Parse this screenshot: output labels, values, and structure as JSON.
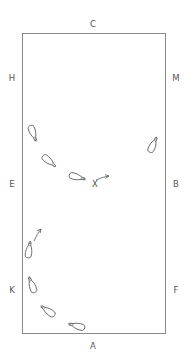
{
  "diagram": {
    "type": "dressage-arena-exercise",
    "arena": {
      "x": 22,
      "y": 33,
      "width": 144,
      "height": 301,
      "stroke": "#8a8a8a"
    },
    "markers": [
      {
        "label": "C",
        "x": 93,
        "y": 24
      },
      {
        "label": "H",
        "x": 12,
        "y": 78
      },
      {
        "label": "M",
        "x": 176,
        "y": 78
      },
      {
        "label": "E",
        "x": 12,
        "y": 184
      },
      {
        "label": "B",
        "x": 176,
        "y": 184
      },
      {
        "label": "X",
        "x": 95,
        "y": 184
      },
      {
        "label": "K",
        "x": 12,
        "y": 290
      },
      {
        "label": "F",
        "x": 176,
        "y": 290
      },
      {
        "label": "A",
        "x": 93,
        "y": 346
      }
    ],
    "horses": [
      {
        "id": "h1",
        "cx": 33,
        "cy": 133,
        "angle": 160
      },
      {
        "id": "h2",
        "cx": 49,
        "cy": 161,
        "angle": 130
      },
      {
        "id": "h3",
        "cx": 77,
        "cy": 177,
        "angle": 105
      },
      {
        "id": "h4",
        "cx": 153,
        "cy": 145,
        "angle": 25
      },
      {
        "id": "h5",
        "cx": 29,
        "cy": 250,
        "angle": 8
      },
      {
        "id": "h6",
        "cx": 32,
        "cy": 285,
        "angle": -20
      },
      {
        "id": "h7",
        "cx": 48,
        "cy": 311,
        "angle": -55
      },
      {
        "id": "h8",
        "cx": 77,
        "cy": 326,
        "angle": -75
      }
    ],
    "arrows": [
      {
        "id": "arrow-x",
        "x1": 96,
        "y1": 180,
        "x2": 109,
        "y2": 176
      },
      {
        "id": "arrow-up",
        "x1": 34,
        "y1": 241,
        "x2": 41,
        "y2": 229
      }
    ],
    "colors": {
      "line": "#555555",
      "label": "#555555",
      "arena": "#8a8a8a"
    }
  }
}
